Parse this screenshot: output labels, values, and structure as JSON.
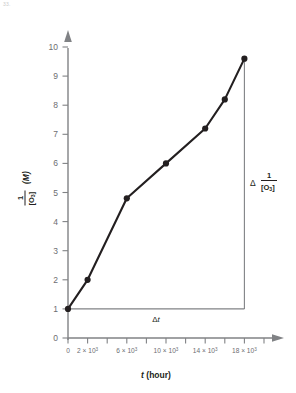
{
  "figure": {
    "corner_note": "33.",
    "background_color": "#ffffff",
    "ink_color": "#231f20",
    "axis_color": "#808285",
    "series_color": "#231f20"
  },
  "chart_data": {
    "type": "line",
    "title": "",
    "subtitle": "",
    "xlabel": "t (hour)",
    "ylabel": "1/[O3] (M)",
    "ylabel_numerator": "1",
    "ylabel_denominator": "[O",
    "ylabel_denominator_sub": "3",
    "ylabel_denominator_close": "]",
    "ylabel_units": "(M)",
    "xlabel_italic_symbol": "t",
    "xlabel_units": "(hour)",
    "grid": false,
    "legend": false,
    "xlim": [
      0,
      20000
    ],
    "ylim": [
      0,
      10.6
    ],
    "x_tick_values": [
      0,
      2000,
      4000,
      6000,
      8000,
      10000,
      12000,
      14000,
      16000,
      18000,
      20000
    ],
    "x_tick_labels": [
      {
        "value": 0,
        "mantissa": "0",
        "factor": "",
        "exponent": ""
      },
      {
        "value": 2000,
        "mantissa": "2",
        "factor": " × 10",
        "exponent": "3"
      },
      {
        "value": 6000,
        "mantissa": "6",
        "factor": " × 10",
        "exponent": "3"
      },
      {
        "value": 10000,
        "mantissa": "10",
        "factor": " × 10",
        "exponent": "3"
      },
      {
        "value": 14000,
        "mantissa": "14",
        "factor": " × 10",
        "exponent": "3"
      },
      {
        "value": 18000,
        "mantissa": "18",
        "factor": " × 10",
        "exponent": "3"
      }
    ],
    "y_tick_values": [
      0,
      1,
      2,
      3,
      4,
      5,
      6,
      7,
      8,
      9,
      10
    ],
    "y_tick_labels": [
      "0",
      "1",
      "2",
      "3",
      "4",
      "5",
      "6",
      "7",
      "8",
      "9",
      "10"
    ],
    "series": [
      {
        "name": "1/[O3] vs t",
        "marker": "filled-circle",
        "x": [
          0,
          2000,
          6000,
          10000,
          14000,
          16000,
          18000
        ],
        "y": [
          1.0,
          2.0,
          4.8,
          6.0,
          7.2,
          8.2,
          9.6
        ]
      }
    ],
    "annotations": [
      {
        "name": "delta-t",
        "label": "Δt",
        "label_delta": "Δ",
        "label_italic": "t",
        "type": "horizontal-leg",
        "from": [
          0,
          1.0
        ],
        "to": [
          18000,
          1.0
        ]
      },
      {
        "name": "delta-one-over-o3",
        "label": "Δ 1/[O3]",
        "label_delta": "Δ",
        "label_numerator": "1",
        "label_denominator": "[O",
        "label_denominator_sub": "3",
        "label_denominator_close": "]",
        "type": "vertical-leg",
        "from": [
          18000,
          1.0
        ],
        "to": [
          18000,
          9.6
        ]
      }
    ]
  }
}
